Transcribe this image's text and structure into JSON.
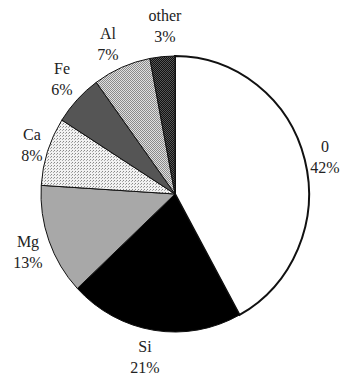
{
  "chart_data": {
    "type": "pie",
    "title": "",
    "start_angle_deg": 0,
    "direction": "clockwise",
    "categories": [
      "0",
      "Si",
      "Mg",
      "Ca",
      "Fe",
      "Al",
      "other"
    ],
    "values": [
      42,
      21,
      13,
      8,
      6,
      7,
      3
    ],
    "value_labels": [
      "42%",
      "21%",
      "13%",
      "8%",
      "6%",
      "7%",
      "3%"
    ],
    "slices": [
      {
        "label": "0",
        "value": 42,
        "percent_label": "42%",
        "fill": "#ffffff",
        "pattern": "none"
      },
      {
        "label": "Si",
        "value": 21,
        "percent_label": "21%",
        "fill": "#000000",
        "pattern": "solid"
      },
      {
        "label": "Mg",
        "value": 13,
        "percent_label": "13%",
        "fill": "#a8a8a8",
        "pattern": "solid"
      },
      {
        "label": "Ca",
        "value": 8,
        "percent_label": "8%",
        "fill": "#ececec",
        "pattern": "dots"
      },
      {
        "label": "Fe",
        "value": 6,
        "percent_label": "6%",
        "fill": "#555555",
        "pattern": "solid"
      },
      {
        "label": "Al",
        "value": 7,
        "percent_label": "7%",
        "fill": "#c4c4c4",
        "pattern": "hatch"
      },
      {
        "label": "other",
        "value": 3,
        "percent_label": "3%",
        "fill": "#2a2a2a",
        "pattern": "checker"
      }
    ],
    "legend": "none",
    "grid": false
  },
  "labels": [
    {
      "name": "0",
      "pct": "42%",
      "x": 325,
      "y": 136
    },
    {
      "name": "Si",
      "pct": "21%",
      "x": 145,
      "y": 336
    },
    {
      "name": "Mg",
      "pct": "13%",
      "x": 28,
      "y": 231
    },
    {
      "name": "Ca",
      "pct": "8%",
      "x": 32,
      "y": 124
    },
    {
      "name": "Fe",
      "pct": "6%",
      "x": 62,
      "y": 58
    },
    {
      "name": "Al",
      "pct": "7%",
      "x": 108,
      "y": 23
    },
    {
      "name": "other",
      "pct": "3%",
      "x": 165,
      "y": 5
    }
  ]
}
